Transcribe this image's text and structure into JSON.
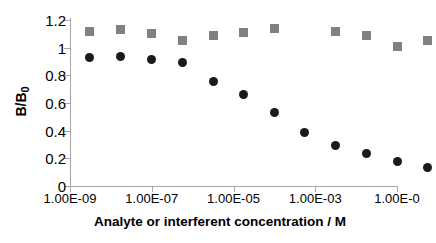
{
  "chart_data": {
    "type": "scatter",
    "title": "",
    "xlabel": "Analyte or interferent concentration / M",
    "ylabel": "B/B0",
    "ylabel_base": "B/B",
    "ylabel_sub": "0",
    "xscale": "log",
    "xlim": [
      1e-09,
      0.1
    ],
    "ylim": [
      0,
      1.2
    ],
    "grid": false,
    "legend": "none",
    "ytick_labels": [
      "0",
      "0.2",
      "0.4",
      "0.6",
      "0.8",
      "1",
      "1.2"
    ],
    "ytick_values": [
      0,
      0.2,
      0.4,
      0.6,
      0.8,
      1,
      1.2
    ],
    "xtick_labels": [
      "1.00E-09",
      "1.00E-07",
      "1.00E-05",
      "1.00E-03",
      "1.00E-0"
    ],
    "xtick_values": [
      1e-09,
      1e-07,
      1e-05,
      0.001,
      0.1
    ],
    "series": [
      {
        "name": "Analyte",
        "marker": "circle",
        "color": "#1a1a1a",
        "points": [
          {
            "x": 3e-09,
            "y": 0.93
          },
          {
            "x": 1.7e-08,
            "y": 0.935
          },
          {
            "x": 1e-07,
            "y": 0.915
          },
          {
            "x": 5.5e-07,
            "y": 0.89
          },
          {
            "x": 3.2e-06,
            "y": 0.755
          },
          {
            "x": 1.8e-05,
            "y": 0.665
          },
          {
            "x": 0.0001,
            "y": 0.53
          },
          {
            "x": 0.00055,
            "y": 0.39
          },
          {
            "x": 0.0032,
            "y": 0.29
          },
          {
            "x": 0.018,
            "y": 0.235
          },
          {
            "x": 0.1,
            "y": 0.175
          },
          {
            "x": 0.55,
            "y": 0.135
          }
        ]
      },
      {
        "name": "Interferent",
        "marker": "square",
        "color": "#808080",
        "points": [
          {
            "x": 3e-09,
            "y": 1.12
          },
          {
            "x": 1.7e-08,
            "y": 1.13
          },
          {
            "x": 1e-07,
            "y": 1.1
          },
          {
            "x": 5.5e-07,
            "y": 1.055
          },
          {
            "x": 3.2e-06,
            "y": 1.09
          },
          {
            "x": 1.8e-05,
            "y": 1.11
          },
          {
            "x": 0.0001,
            "y": 1.14
          },
          {
            "x": 0.0032,
            "y": 1.115
          },
          {
            "x": 0.018,
            "y": 1.09
          },
          {
            "x": 0.1,
            "y": 1.01
          },
          {
            "x": 0.55,
            "y": 1.055
          }
        ]
      }
    ]
  }
}
